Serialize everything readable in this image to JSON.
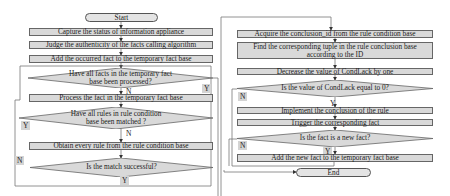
{
  "diagram": {
    "type": "flowchart",
    "colors": {
      "box_fill": "#d9d9d9",
      "line": "#666666",
      "label_fill": "#d4d4d4",
      "background": "#ffffff"
    },
    "left_column": {
      "start": "Start",
      "capture": "Capture the status of information appliance",
      "judge": "Judge the authenticity of the facts calling algorithm",
      "add_occurred": "Add the occurred fact to the temporary fact base",
      "decision_all_facts": "Have all facts in the temporary fact base been processed?",
      "decision_all_facts_yes": "Y",
      "decision_all_facts_no": "N",
      "process": "Process the fact in the temporary fact base",
      "decision_all_rules": "Have all rules in rule condition base been matched ?",
      "decision_all_rules_yes": "Y",
      "decision_all_rules_no": "N",
      "obtain": "Obtain every rule from the rule condition base",
      "decision_match": "Is the match successful?",
      "decision_match_no": "N",
      "decision_match_yes": "Y"
    },
    "right_column": {
      "acquire": "Acquire the conclusion_id from the rule condition base",
      "find": "Find the corresponding tuple in the rule conclusion base according to the ID",
      "decrease": "Decrease the value of CondLack by one",
      "decision_condlack": "Is the value of CondLack equal to 0?",
      "decision_condlack_no": "N",
      "decision_condlack_yes": "Y",
      "implement": "Implement the conclusion of the rule",
      "trigger": "Trigger the corresponding fact",
      "decision_new_fact": "Is the fact is a new fact?",
      "decision_new_fact_no": "N",
      "decision_new_fact_yes": "Y",
      "add_new": "Add the new fact to the temporary fact base",
      "end": "End"
    }
  }
}
